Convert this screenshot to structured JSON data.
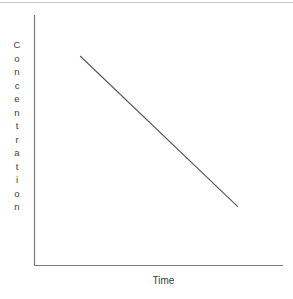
{
  "figure": {
    "background_color": "#ffffff",
    "top_rule_color": "#c8c8c8",
    "axis_color": "#7a7a7a",
    "line_color": "#555555",
    "text_color": "#3c3c3c"
  },
  "axes": {
    "y_title": "Concentration",
    "x_title": "Time"
  },
  "chart_data": {
    "type": "line",
    "title": "",
    "subtitle": "",
    "xlabel": "Time",
    "ylabel": "Concentration",
    "xlim": [
      0,
      1
    ],
    "ylim": [
      0,
      1
    ],
    "grid": false,
    "legend": null,
    "axis_ticks": {
      "x": [],
      "y": []
    },
    "annotations": [],
    "series": [
      {
        "name": "Concentration vs Time",
        "style": "solid",
        "color": "#555555",
        "x": [
          0.108,
          1.0
        ],
        "y": [
          1.0,
          0.152
        ],
        "description": "Single straight line decreasing linearly from upper-left to lower-right"
      }
    ]
  }
}
